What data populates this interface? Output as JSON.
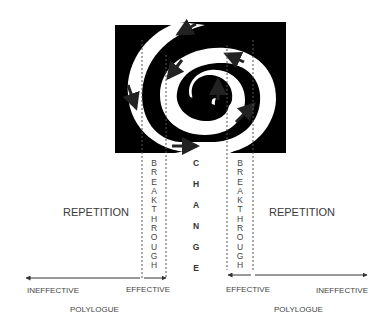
{
  "diagram": {
    "spiral": {
      "fill": "#000000",
      "background": "#ffffff",
      "arrow_color": "#222222"
    },
    "labels": {
      "repetition_left": "REPETITION",
      "repetition_right": "REPETITION",
      "breakthrough_left": "BREAKTHROUGH",
      "breakthrough_right": "BREAKTHROUGH",
      "change": "CHANGE",
      "ineffective_left": "INEFFECTIVE",
      "effective_left": "EFFECTIVE",
      "effective_right": "EFFECTIVE",
      "ineffective_right": "INEFFECTIVE",
      "polylogue_left": "POLYLOGUE",
      "polylogue_right": "POLYLOGUE"
    },
    "breakthrough_letters": [
      "B",
      "R",
      "E",
      "A",
      "K",
      "T",
      "H",
      "R",
      "O",
      "U",
      "G",
      "H"
    ],
    "change_letters": [
      "C",
      "H",
      "A",
      "N",
      "G",
      "E"
    ]
  }
}
